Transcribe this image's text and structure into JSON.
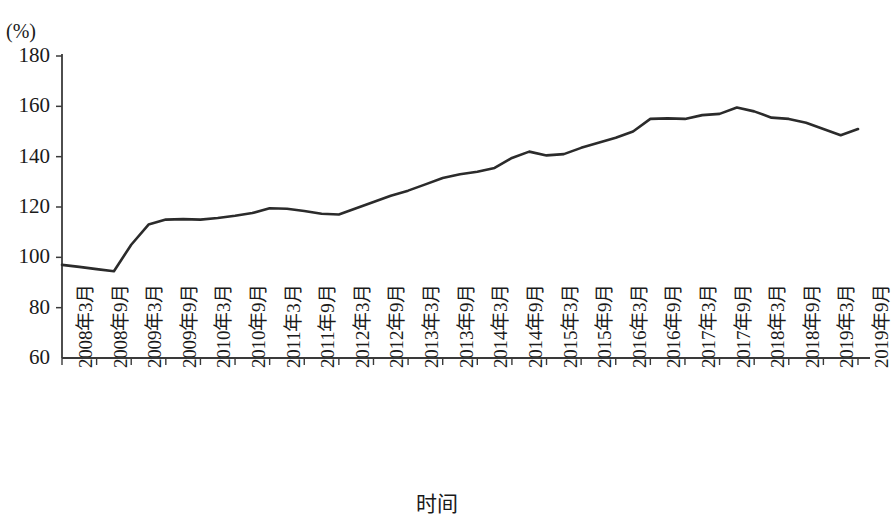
{
  "chart_data": {
    "type": "line",
    "title": "",
    "unit_label": "(%)",
    "xlabel": "时间",
    "ylabel": "",
    "ylim": [
      60,
      180
    ],
    "ytick_labels": [
      "180",
      "160",
      "140",
      "120",
      "100",
      "80",
      "60"
    ],
    "ytick_values": [
      180,
      160,
      140,
      120,
      100,
      80,
      60
    ],
    "grid": false,
    "legend": "none",
    "categories": [
      "2008年3月",
      "2008年9月",
      "2009年3月",
      "2009年9月",
      "2010年3月",
      "2010年9月",
      "2011年3月",
      "2011年9月",
      "2012年3月",
      "2012年9月",
      "2013年3月",
      "2013年9月",
      "2014年3月",
      "2014年9月",
      "2015年3月",
      "2015年9月",
      "2016年3月",
      "2016年9月",
      "2017年3月",
      "2017年9月",
      "2018年3月",
      "2018年9月",
      "2019年3月",
      "2019年9月"
    ],
    "series": [
      {
        "name": "指数",
        "x": [
          "2008年3月",
          "2008年6月",
          "2008年9月",
          "2008年12月",
          "2009年3月",
          "2009年6月",
          "2009年9月",
          "2009年12月",
          "2010年3月",
          "2010年6月",
          "2010年9月",
          "2010年12月",
          "2011年3月",
          "2011年6月",
          "2011年9月",
          "2011年12月",
          "2012年3月",
          "2012年6月",
          "2012年9月",
          "2012年12月",
          "2013年3月",
          "2013年6月",
          "2013年9月",
          "2013年12月",
          "2014年3月",
          "2014年6月",
          "2014年9月",
          "2014年12月",
          "2015年3月",
          "2015年6月",
          "2015年9月",
          "2015年12月",
          "2016年3月",
          "2016年6月",
          "2016年9月",
          "2016年12月",
          "2017年3月",
          "2017年6月",
          "2017年9月",
          "2017年12月",
          "2018年3月",
          "2018年6月",
          "2018年9月",
          "2018年12月",
          "2019年3月",
          "2019年6月",
          "2019年9月"
        ],
        "values": [
          97.0,
          96.2,
          95.3,
          94.5,
          105.0,
          113.0,
          115.0,
          115.2,
          115.0,
          115.6,
          116.5,
          117.6,
          119.5,
          119.3,
          118.4,
          117.3,
          117.0,
          119.5,
          122.0,
          124.5,
          126.5,
          129.0,
          131.5,
          133.0,
          134.0,
          135.5,
          139.5,
          142.0,
          140.5,
          141.0,
          143.5,
          145.5,
          147.5,
          150.0,
          155.0,
          155.2,
          155.0,
          156.5,
          157.0,
          159.5,
          158.0,
          155.5,
          155.0,
          153.5,
          151.0,
          148.5,
          151.0
        ]
      }
    ],
    "line_color": "#2b2b2b",
    "axis_color": "#3a3a3a"
  }
}
